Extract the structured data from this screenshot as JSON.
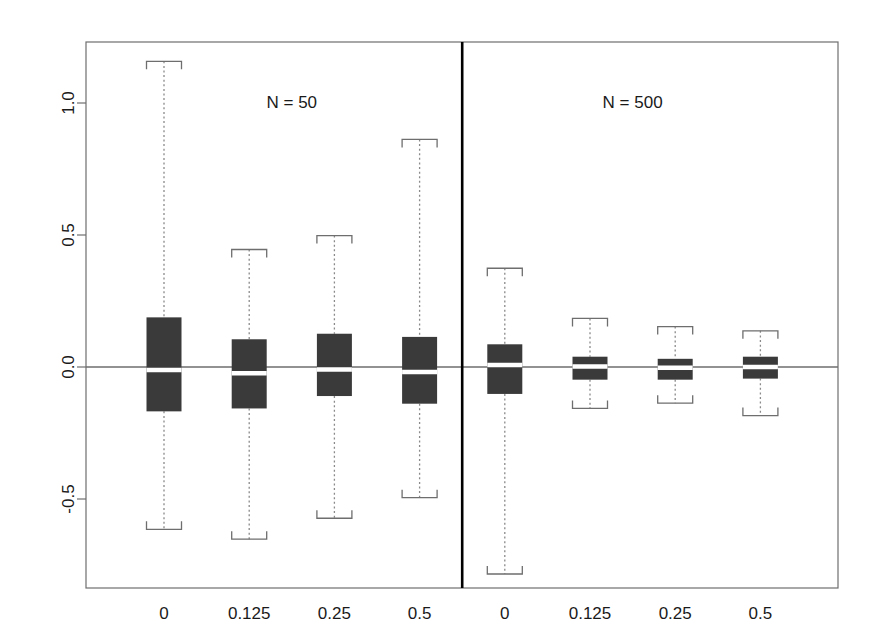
{
  "chart_data": {
    "type": "box",
    "title": "",
    "xlabel": "",
    "ylabel": "",
    "ylim": [
      -0.92,
      1.27
    ],
    "xlim": [
      0,
      9
    ],
    "grid": false,
    "legend": false,
    "yticks": [
      -0.5,
      0.0,
      0.5,
      1.0
    ],
    "ytick_labels": [
      "-0.5",
      "0.0",
      "0.5",
      "1.0"
    ],
    "reference_line": 0.0,
    "panels": [
      {
        "label": "N = 50",
        "center_x": 2.5
      },
      {
        "label": "N = 500",
        "center_x": 6.5
      }
    ],
    "panel_divider_x": 4.5,
    "categories": [
      "0",
      "0.125",
      "0.25",
      "0.5",
      "0",
      "0.125",
      "0.25",
      "0.5"
    ],
    "boxes": [
      {
        "group": "N = 50",
        "category": "0",
        "x": 1,
        "whisker_low": -0.615,
        "q1": -0.168,
        "median": -0.011,
        "q3": 0.188,
        "whisker_high": 1.158
      },
      {
        "group": "N = 50",
        "category": "0.125",
        "x": 2,
        "whisker_low": -0.652,
        "q1": -0.157,
        "median": -0.024,
        "q3": 0.105,
        "whisker_high": 0.445
      },
      {
        "group": "N = 50",
        "category": "0.25",
        "x": 3,
        "whisker_low": -0.573,
        "q1": -0.11,
        "median": -0.009,
        "q3": 0.126,
        "whisker_high": 0.498
      },
      {
        "group": "N = 50",
        "category": "0.5",
        "x": 4,
        "whisker_low": -0.495,
        "q1": -0.139,
        "median": -0.019,
        "q3": 0.114,
        "whisker_high": 0.862
      },
      {
        "group": "N = 500",
        "category": "0",
        "x": 5,
        "whisker_low": -0.784,
        "q1": -0.102,
        "median": 0.008,
        "q3": 0.086,
        "whisker_high": 0.374
      },
      {
        "group": "N = 500",
        "category": "0.125",
        "x": 6,
        "whisker_low": -0.157,
        "q1": -0.048,
        "median": 0.002,
        "q3": 0.039,
        "whisker_high": 0.184
      },
      {
        "group": "N = 500",
        "category": "0.25",
        "x": 7,
        "whisker_low": -0.137,
        "q1": -0.048,
        "median": -0.003,
        "q3": 0.031,
        "whisker_high": 0.153
      },
      {
        "group": "N = 500",
        "category": "0.5",
        "x": 8,
        "whisker_low": -0.184,
        "q1": -0.044,
        "median": 0.0,
        "q3": 0.039,
        "whisker_high": 0.137
      }
    ],
    "colors": {
      "box_fill": "#3a3a3a",
      "median": "#ffffff",
      "whisker": "#8a8a8a",
      "cap": "#6e6e6e",
      "frame": "#6e6e6e",
      "divider": "#000000",
      "reference_line": "#6e6e6e",
      "text": "#1a1a1a",
      "background": "#ffffff"
    }
  }
}
